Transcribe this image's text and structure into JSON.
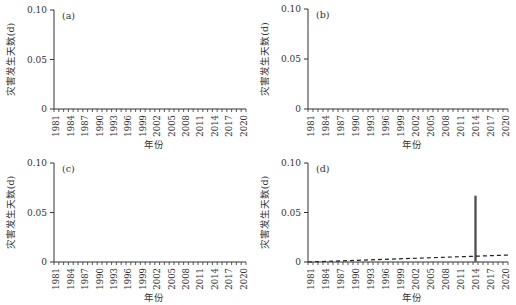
{
  "chart_data": [
    {
      "type": "bar",
      "panel_label": "(a)",
      "xlabel": "年份",
      "ylabel": "灾害发生天数(d)",
      "ylim": [
        0,
        0.1
      ],
      "yticks": [
        "0",
        "0.05",
        "0.10"
      ],
      "ytick_values": [
        0,
        0.05,
        0.1
      ],
      "x_start": 1981,
      "x_end": 2020,
      "xtick_labels": [
        "1981",
        "1984",
        "1987",
        "1990",
        "1993",
        "1996",
        "1999",
        "2002",
        "2005",
        "2008",
        "2011",
        "2014",
        "2017",
        "2020"
      ],
      "values": {},
      "trend": null
    },
    {
      "type": "bar",
      "panel_label": "(b)",
      "xlabel": "年份",
      "ylabel": "灾害发生天数(d)",
      "ylim": [
        0,
        0.1
      ],
      "yticks": [
        "0",
        "0.05",
        "0.10"
      ],
      "ytick_values": [
        0,
        0.05,
        0.1
      ],
      "x_start": 1981,
      "x_end": 2020,
      "xtick_labels": [
        "1981",
        "1984",
        "1987",
        "1990",
        "1993",
        "1996",
        "1999",
        "2002",
        "2005",
        "2008",
        "2011",
        "2014",
        "2017",
        "2020"
      ],
      "values": {},
      "trend": null
    },
    {
      "type": "bar",
      "panel_label": "(c)",
      "xlabel": "年份",
      "ylabel": "灾害发生天数(d)",
      "ylim": [
        0,
        0.1
      ],
      "yticks": [
        "0",
        "0.05",
        "0.10"
      ],
      "ytick_values": [
        0,
        0.05,
        0.1
      ],
      "x_start": 1981,
      "x_end": 2020,
      "xtick_labels": [
        "1981",
        "1984",
        "1987",
        "1990",
        "1993",
        "1996",
        "1999",
        "2002",
        "2005",
        "2008",
        "2011",
        "2014",
        "2017",
        "2020"
      ],
      "values": {},
      "trend": null
    },
    {
      "type": "bar",
      "panel_label": "(d)",
      "xlabel": "年份",
      "ylabel": "灾害发生天数(d)",
      "ylim": [
        0,
        0.1
      ],
      "yticks": [
        "0",
        "0.05",
        "0.10"
      ],
      "ytick_values": [
        0,
        0.05,
        0.1
      ],
      "x_start": 1981,
      "x_end": 2020,
      "xtick_labels": [
        "1981",
        "1984",
        "1987",
        "1990",
        "1993",
        "1996",
        "1999",
        "2002",
        "2005",
        "2008",
        "2011",
        "2014",
        "2017",
        "2020"
      ],
      "values": {
        "2014": 0.067
      },
      "trend": {
        "style": "dashed",
        "start_year": 1981,
        "start_value": -0.001,
        "end_year": 2020,
        "end_value": 0.007
      }
    }
  ],
  "colors": {
    "axis": "#333333",
    "bar": "#555555",
    "trend": "#222222"
  }
}
